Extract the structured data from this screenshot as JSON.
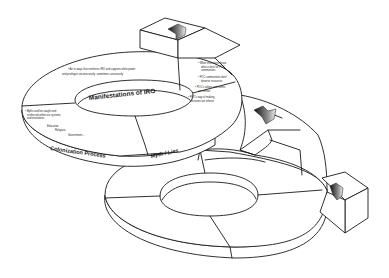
{
  "diagram": {
    "type": "3d-spiral-ribbon",
    "colors": {
      "stroke": "#1a1a1a",
      "fill": "#ffffff",
      "arrow_dark": "#222222",
      "arrow_light": "#d8d8d8"
    },
    "segments": {
      "manifestations": {
        "title": "Manifestations of IRO",
        "bullets": [
          "• Act in ways that reinforces IRO and supports white power",
          "and privileges unconsciously; sometimes consciously"
        ]
      },
      "myth_lies": {
        "title": "Myth / Lies",
        "bullets": [
          "• White institutions know",
          "what is best for POC",
          "communities",
          "• POC communities don't",
          "deserve resources",
          "• POC's values and norms",
          "are inferior",
          "• POC's way of making",
          "decisions are inferior"
        ]
      },
      "colonization": {
        "title": "Colonization Process",
        "bullets": [
          "• Myths and lies taught and",
          "reinforced within our systems",
          "and institutions"
        ],
        "sub_items": [
          "Education",
          "Religious",
          "Government..."
        ]
      }
    },
    "arrows": [
      {
        "name": "top-arrow",
        "direction": "down-left"
      },
      {
        "name": "middle-arrow",
        "direction": "down-right"
      },
      {
        "name": "bottom-arrow",
        "direction": "right"
      }
    ]
  }
}
